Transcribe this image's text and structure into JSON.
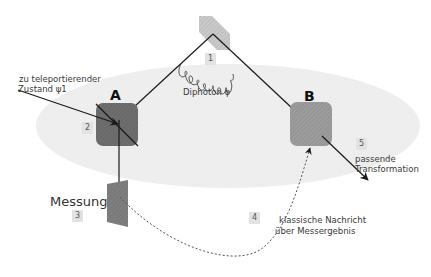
{
  "diagram": {
    "type": "quantum-teleportation",
    "nodes": {
      "A": {
        "label": "A"
      },
      "B": {
        "label": "B"
      }
    },
    "labels": {
      "input_state_line1": "zu teleportierender",
      "input_state_line2": "Zustand ψ1",
      "diphoton": "Diphoton φ",
      "measurement": "Messung",
      "classical_line1": "klassische Nachricht",
      "classical_line2": "über Messergebnis",
      "transform_line1": "passende",
      "transform_line2": "Transformation"
    },
    "steps": [
      "1",
      "2",
      "3",
      "4",
      "5"
    ],
    "colors": {
      "ellipse": "#efefef",
      "node_A": "#6e6e6e",
      "node_B": "#9a9a9a",
      "source_crystal": "#c8c8c8",
      "measure_crystal": "#808080",
      "lines": "#1a1a1a",
      "step_badge": "#e2e2e2"
    }
  }
}
